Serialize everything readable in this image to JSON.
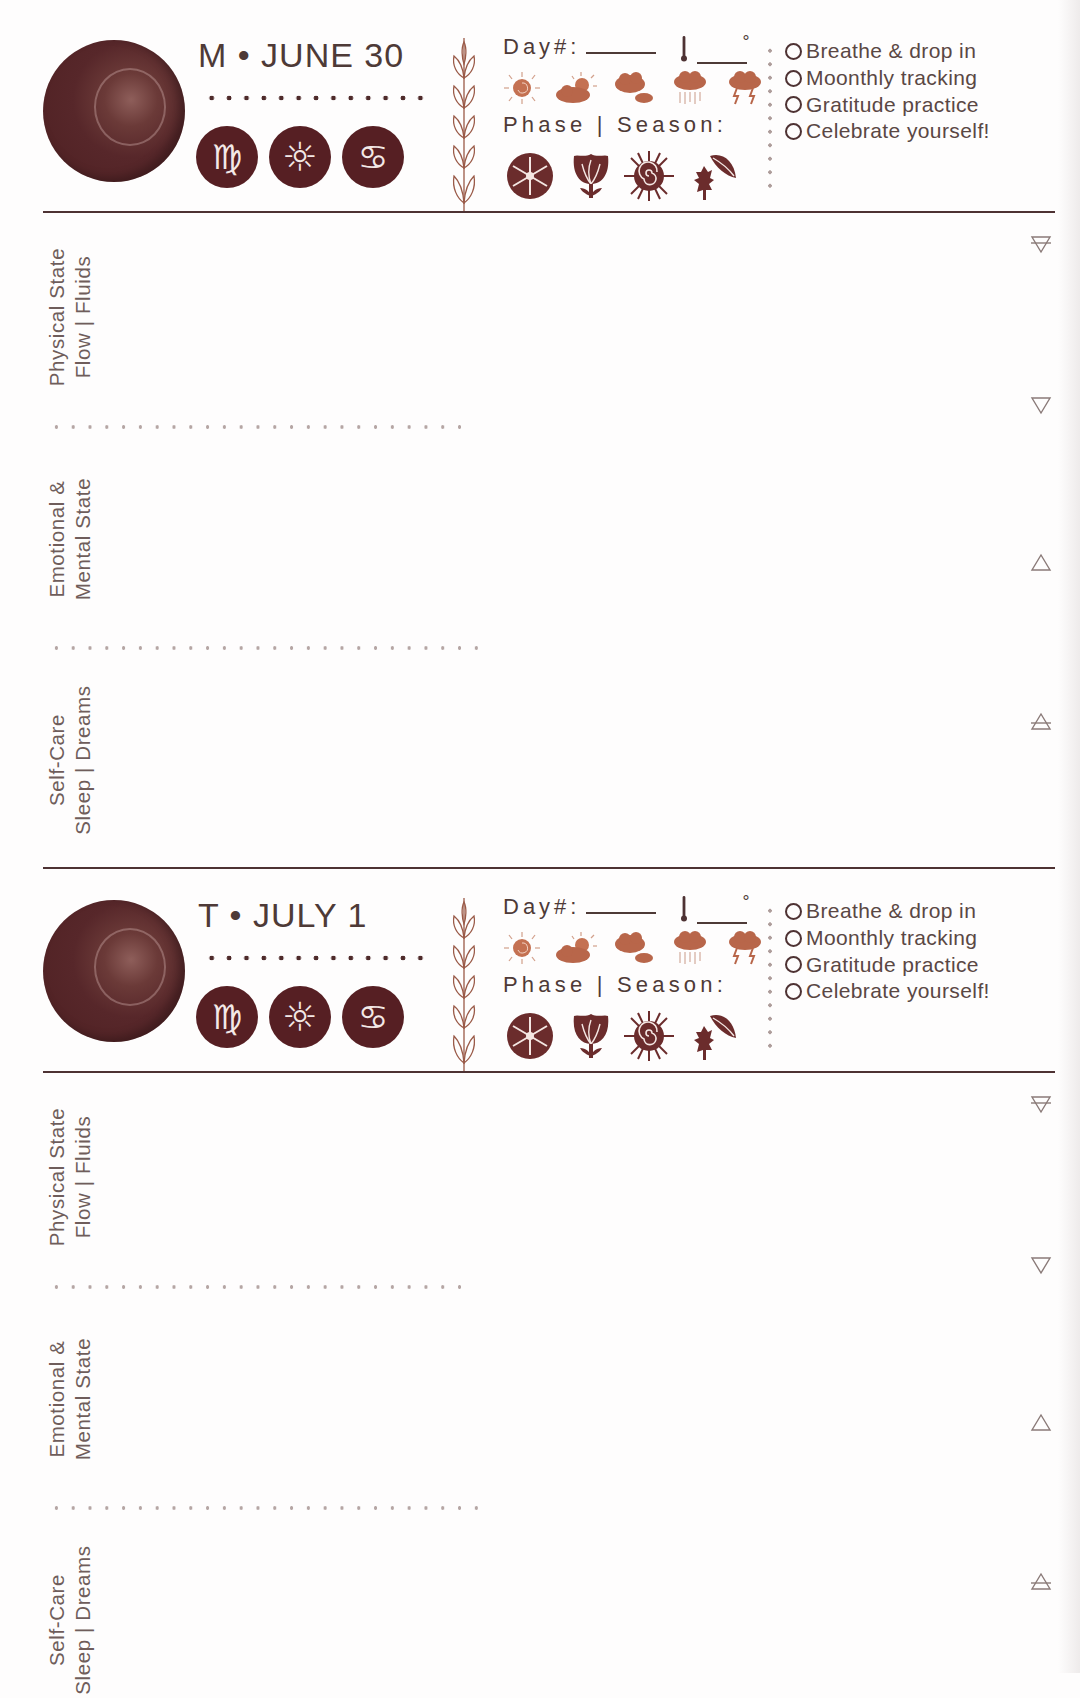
{
  "colors": {
    "ink": "#561f23",
    "text": "#5a4744",
    "weather_orange": "#b8664a",
    "rule": "#4e3233",
    "dots": "#b5a6a4"
  },
  "days": [
    {
      "date_label": "M • JUNE 30",
      "moon_icon": "moon-phase-full",
      "astro_icons": [
        {
          "name": "virgo-icon",
          "glyph": "♍"
        },
        {
          "name": "sun-icon",
          "glyph": "☼"
        },
        {
          "name": "cancer-icon",
          "glyph": "♋"
        }
      ],
      "day_number_label": "Day#:",
      "degree_symbol": "°",
      "weather_icons": [
        "sunny-icon",
        "partly-cloudy-icon",
        "cloudy-icon",
        "rain-icon",
        "thunderstorm-icon"
      ],
      "phase_season_label": "Phase | Season:",
      "season_icons": [
        "winter-snowflake-icon",
        "spring-tulip-icon",
        "summer-sun-icon",
        "autumn-leaves-icon"
      ],
      "checklist": [
        {
          "label": "Breathe & drop in",
          "checked": false
        },
        {
          "label": "Moonthly tracking",
          "checked": false
        },
        {
          "label": "Gratitude practice",
          "checked": false
        },
        {
          "label": "Celebrate yourself!",
          "checked": false
        }
      ],
      "sections": [
        {
          "line1": "Physical State",
          "line2": "Flow | Fluids"
        },
        {
          "line1": "Emotional &",
          "line2": "Mental State"
        },
        {
          "line1": "Self-Care",
          "line2": "Sleep | Dreams"
        }
      ],
      "element_icons": [
        "earth-element-icon",
        "water-element-icon",
        "fire-element-icon",
        "air-element-icon"
      ]
    },
    {
      "date_label": "T • JULY 1",
      "moon_icon": "moon-phase-full",
      "astro_icons": [
        {
          "name": "virgo-icon",
          "glyph": "♍"
        },
        {
          "name": "sun-icon",
          "glyph": "☼"
        },
        {
          "name": "cancer-icon",
          "glyph": "♋"
        }
      ],
      "day_number_label": "Day#:",
      "degree_symbol": "°",
      "weather_icons": [
        "sunny-icon",
        "partly-cloudy-icon",
        "cloudy-icon",
        "rain-icon",
        "thunderstorm-icon"
      ],
      "phase_season_label": "Phase | Season:",
      "season_icons": [
        "winter-snowflake-icon",
        "spring-tulip-icon",
        "summer-sun-icon",
        "autumn-leaves-icon"
      ],
      "checklist": [
        {
          "label": "Breathe & drop in",
          "checked": false
        },
        {
          "label": "Moonthly tracking",
          "checked": false
        },
        {
          "label": "Gratitude practice",
          "checked": false
        },
        {
          "label": "Celebrate yourself!",
          "checked": false
        }
      ],
      "sections": [
        {
          "line1": "Physical State",
          "line2": "Flow | Fluids"
        },
        {
          "line1": "Emotional &",
          "line2": "Mental State"
        },
        {
          "line1": "Self-Care",
          "line2": "Sleep | Dreams"
        }
      ],
      "element_icons": [
        "earth-element-icon",
        "water-element-icon",
        "fire-element-icon",
        "air-element-icon"
      ]
    }
  ]
}
